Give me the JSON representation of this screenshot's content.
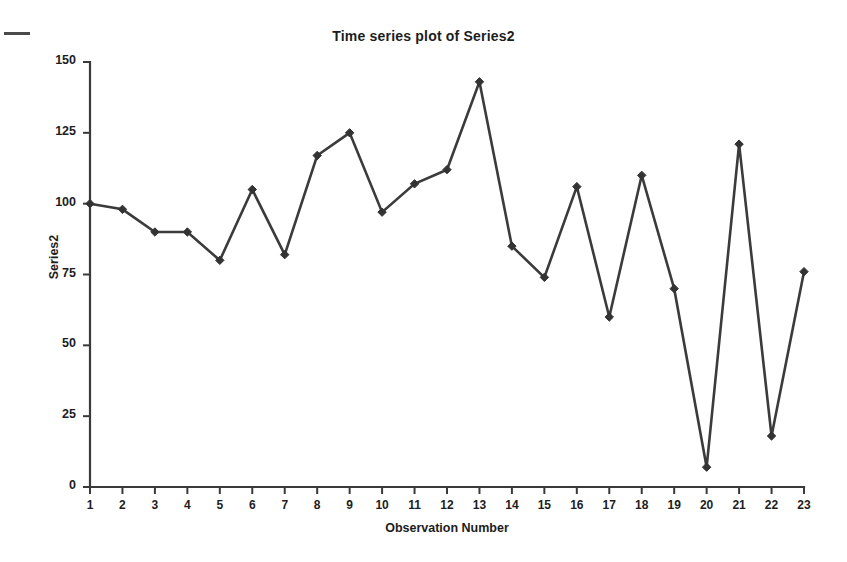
{
  "chart_data": {
    "type": "line",
    "title": "Time series plot of Series2",
    "xlabel": "Observation Number",
    "ylabel": "Series2",
    "x": [
      1,
      2,
      3,
      4,
      5,
      6,
      7,
      8,
      9,
      10,
      11,
      12,
      13,
      14,
      15,
      16,
      17,
      18,
      19,
      20,
      21,
      22,
      23
    ],
    "values": [
      100,
      98,
      90,
      90,
      80,
      105,
      82,
      117,
      125,
      97,
      107,
      112,
      143,
      85,
      74,
      106,
      60,
      110,
      70,
      7,
      121,
      18,
      76
    ],
    "series": [
      {
        "name": "Series2",
        "values": [
          100,
          98,
          90,
          90,
          80,
          105,
          82,
          117,
          125,
          97,
          107,
          112,
          143,
          85,
          74,
          106,
          60,
          110,
          70,
          7,
          121,
          18,
          76
        ]
      }
    ],
    "xlim": [
      1,
      23
    ],
    "ylim": [
      0,
      150
    ],
    "x_ticks": [
      "1",
      "2",
      "3",
      "4",
      "5",
      "6",
      "7",
      "8",
      "9",
      "10",
      "11",
      "12",
      "13",
      "14",
      "15",
      "16",
      "17",
      "18",
      "19",
      "20",
      "21",
      "22",
      "23"
    ],
    "y_ticks": [
      "0",
      "25",
      "50",
      "75",
      "100",
      "125",
      "150"
    ],
    "y_tick_values": [
      0,
      25,
      50,
      75,
      100,
      125,
      150
    ],
    "grid": false,
    "legend": false,
    "marker": "diamond",
    "line_color": "#3b3b3b",
    "marker_color": "#333333",
    "background_color": "#ffffff"
  },
  "annotations": {
    "scan_mark": "scan-artifact-dash"
  }
}
